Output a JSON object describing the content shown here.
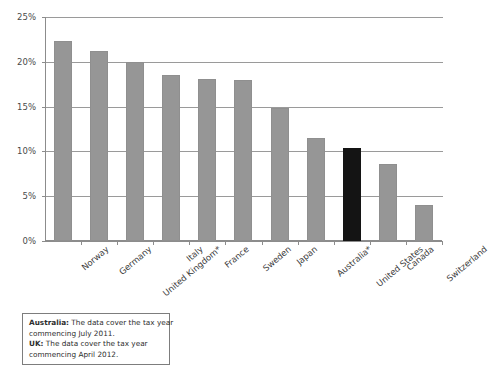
{
  "chart_data": {
    "type": "bar",
    "title": "",
    "subtitle": "",
    "xlabel": "",
    "ylabel": "",
    "ylim": [
      0,
      25
    ],
    "grid": true,
    "legend": false,
    "y_tick_labels": [
      "25%",
      "20%",
      "15%",
      "10%",
      "5%",
      "0%"
    ],
    "y_tick_values": [
      25,
      20,
      15,
      10,
      5,
      0
    ],
    "categories": [
      "Norway",
      "Germany",
      "United Kingdom*",
      "Italy",
      "France",
      "Sweden",
      "Japan",
      "Australia*",
      "United States",
      "Canada",
      "Switzerland"
    ],
    "values": [
      22.3,
      21.2,
      20.0,
      18.5,
      18.1,
      18.0,
      14.8,
      11.5,
      10.4,
      8.6,
      4.0
    ],
    "highlight_category": "United States",
    "colors": {
      "bar": "#969696",
      "bar_highlight": "#141414",
      "grid": "#9a9a9a",
      "axis": "#8c8c8c",
      "text": "#3b3b3b"
    }
  },
  "footnote": {
    "australia_label": "Australia:",
    "australia_text": " The data cover the tax year",
    "australia_text2": "commencing July 2011.",
    "uk_label": "UK:",
    "uk_text": " The data cover the tax year",
    "uk_text2": "commencing April 2012."
  }
}
